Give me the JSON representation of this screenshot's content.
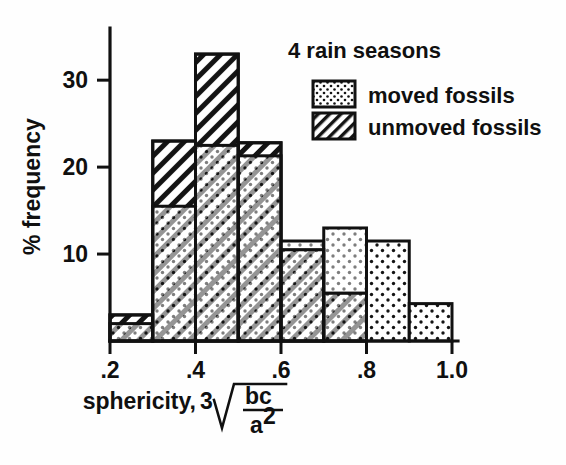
{
  "figure": {
    "kind": "histogram-figure",
    "background_color": "#fefefe",
    "ink_color": "#111111"
  },
  "legend": {
    "title": "4 rain seasons",
    "entries": [
      {
        "label": "moved fossils",
        "swatch": "dotted-swatch"
      },
      {
        "label": "unmoved fossils",
        "swatch": "hatched-swatch"
      }
    ]
  },
  "axes": {
    "y": {
      "label": "% frequency",
      "ticks": [
        "10",
        "20",
        "30"
      ],
      "tick_values": [
        10,
        20,
        30
      ],
      "range": [
        0,
        36
      ]
    },
    "x": {
      "label_prefix": "sphericity,",
      "label_index": "3",
      "label_numerator": "bc",
      "label_denominator": "a",
      "label_denominator_exponent": "2",
      "ticks": [
        ".2",
        ".4",
        ".6",
        ".8",
        "1.0"
      ],
      "tick_values": [
        0.2,
        0.4,
        0.6,
        0.8,
        1.0
      ],
      "range": [
        0.2,
        1.0
      ]
    }
  },
  "chart_data": {
    "type": "bar",
    "title": "4 rain seasons",
    "xlabel": "sphericity, cube root of bc/a^2",
    "ylabel": "% frequency",
    "xlim": [
      0.2,
      1.0
    ],
    "ylim": [
      0,
      36
    ],
    "grid": false,
    "legend_position": "top-right",
    "bin_edges": [
      0.2,
      0.3,
      0.4,
      0.5,
      0.6,
      0.7,
      0.8,
      0.9,
      1.0
    ],
    "categories": [
      ".2-.3",
      ".3-.4",
      ".4-.5",
      ".5-.6",
      ".6-.7",
      ".7-.8",
      ".8-.9",
      ".9-1.0"
    ],
    "series": [
      {
        "name": "moved fossils",
        "pattern": "dots",
        "values": [
          2.0,
          15.5,
          22.5,
          21.3,
          11.5,
          13.0,
          11.5,
          4.3
        ]
      },
      {
        "name": "unmoved fossils",
        "pattern": "hatch",
        "values": [
          3.0,
          23.0,
          33.0,
          22.8,
          10.5,
          5.5,
          0,
          0
        ]
      }
    ]
  }
}
